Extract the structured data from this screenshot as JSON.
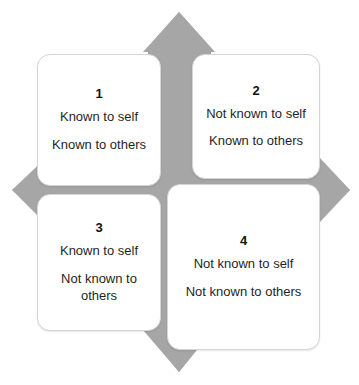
{
  "diagram": {
    "background_shape": "gray-diamond",
    "colors": {
      "diamond_gray": "#a6a6a6",
      "card_background": "#ffffff",
      "card_border": "#d5d5d5",
      "text": "#1f1f1f"
    },
    "quadrants": [
      {
        "number": "1",
        "self_line": "Known to self",
        "others_line": "Known to others"
      },
      {
        "number": "2",
        "self_line": "Not known to self",
        "others_line": "Known to others"
      },
      {
        "number": "3",
        "self_line": "Known to self",
        "others_line": "Not known to others"
      },
      {
        "number": "4",
        "self_line": "Not known to self",
        "others_line": "Not known to others"
      }
    ]
  }
}
